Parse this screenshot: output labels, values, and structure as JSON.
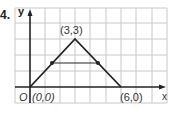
{
  "problem_number": "4.",
  "axes": {
    "x_label": "x",
    "y_label": "y",
    "origin_label": "O"
  },
  "vertices": [
    {
      "label": "(0,0)",
      "x": 0,
      "y": 0
    },
    {
      "label": "(3,3)",
      "x": 3,
      "y": 3
    },
    {
      "label": "(6,0)",
      "x": 6,
      "y": 0
    }
  ],
  "midpoints": [
    {
      "x": 1.5,
      "y": 1.5
    },
    {
      "x": 4.5,
      "y": 1.5
    }
  ],
  "colors": {
    "grid": "#c8c8c8",
    "line": "#222222",
    "text": "#333333"
  }
}
